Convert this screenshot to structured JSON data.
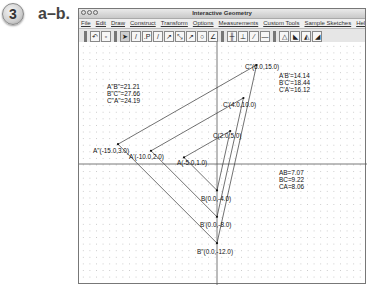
{
  "exercise": {
    "number": "3",
    "label": "a–b."
  },
  "window": {
    "title": "Interactive Geometry",
    "menu": [
      "File",
      "Edit",
      "Draw",
      "Construct",
      "Transform",
      "Options",
      "Measurements",
      "Custom Tools",
      "Sample Sketches",
      "Help"
    ]
  },
  "toolbar": {
    "groups": [
      [
        "undo-icon",
        "redo-icon"
      ],
      [
        "arrow-select-icon",
        "pencil-icon",
        "point-icon",
        "segment-icon",
        "ray-icon",
        "line-icon",
        "vector-icon",
        "circle-icon",
        "angle-icon"
      ],
      [
        "parallel-icon",
        "perpendicular-icon",
        "bisector-icon",
        "midpoint-icon"
      ],
      [
        "triangle-measure-icon",
        "reflect-icon",
        "rotate-icon",
        "dilate-icon"
      ]
    ]
  },
  "canvas": {
    "points": [
      {
        "id": "A",
        "label": "A(-5.0,1.0)",
        "x": -5,
        "y": 1
      },
      {
        "id": "B",
        "label": "B(0.0,-4.0)",
        "x": 0,
        "y": -4
      },
      {
        "id": "C",
        "label": "C(2.0,5.0)",
        "x": 2,
        "y": 5
      },
      {
        "id": "A1",
        "label": "A'(-10.0,2.0)",
        "x": -10,
        "y": 2
      },
      {
        "id": "B1",
        "label": "B'(0.0,-8.0)",
        "x": 0,
        "y": -8
      },
      {
        "id": "C1",
        "label": "C'(4.0,10.0)",
        "x": 4,
        "y": 10
      },
      {
        "id": "A2",
        "label": "A\"(-15.0,3.0)",
        "x": -15,
        "y": 3
      },
      {
        "id": "B2",
        "label": "B\"(0.0,-12.0)",
        "x": 0,
        "y": -12
      },
      {
        "id": "C2",
        "label": "C\"(6.0,15.0)",
        "x": 6,
        "y": 15
      }
    ],
    "measurements": {
      "original": [
        "AB=7.07",
        "BC=9.22",
        "CA=8.06"
      ],
      "image1": [
        "A'B'=14.14",
        "B'C'=18.44",
        "C'A'=16.12"
      ],
      "image2": [
        "A\"B\"=21.21",
        "B\"C\"=27.66",
        "C\"A\"=24.19"
      ]
    }
  }
}
